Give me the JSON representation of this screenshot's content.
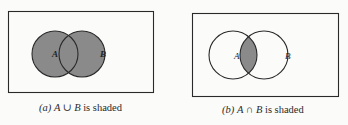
{
  "panels": [
    {
      "id": "a",
      "caption_label": "(a)",
      "caption_expr": "A ∪ B",
      "caption_suffix": " is shaded",
      "set_a_label": "A",
      "set_b_label": "B",
      "shaded_region": "union"
    },
    {
      "id": "b",
      "caption_label": "(b)",
      "caption_expr": "A ∩ B",
      "caption_suffix": " is shaded",
      "set_a_label": "A",
      "set_b_label": "B",
      "shaded_region": "intersection"
    }
  ],
  "colors": {
    "shade": "#8a8a8a",
    "stroke": "#2a2a2a",
    "background": "#fbfbfa"
  }
}
